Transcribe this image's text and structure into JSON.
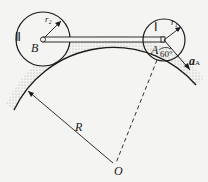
{
  "diagram": {
    "labels": {
      "wheel_2": "Ⅱ",
      "wheel_1": "Ⅰ",
      "center_b": "B",
      "center_a": "A",
      "radius_2": "r₂",
      "radius_1": "r₁",
      "radius_big": "R",
      "center_o": "O",
      "angle": "60°",
      "acceleration": "a",
      "acceleration_sub": "A"
    },
    "colors": {
      "line": "#1a1a1a",
      "background": "#f4f4f2",
      "stipple": "#888888"
    }
  }
}
